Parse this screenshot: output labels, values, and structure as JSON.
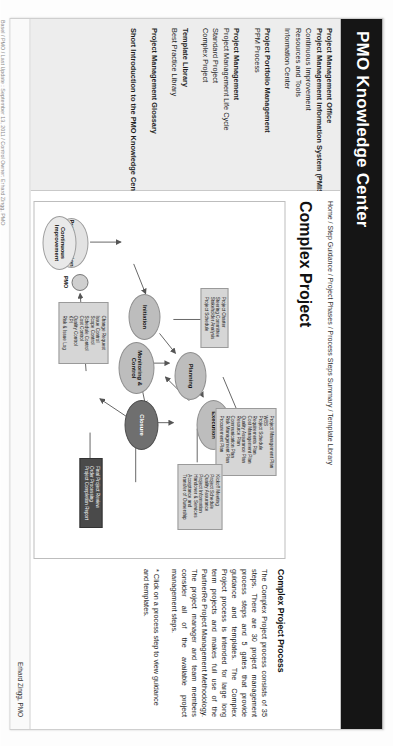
{
  "header": {
    "brand": "PMO Knowledge Center"
  },
  "sidebar": {
    "groups": [
      {
        "items": [
          {
            "label": "Project Management Office",
            "bold": true
          },
          {
            "label": "Project Management Information System (PMIS)",
            "bold": true
          },
          {
            "label": "Continuous Improvement",
            "bold": false
          },
          {
            "label": "Resources and Tools",
            "bold": false
          },
          {
            "label": "Information Center",
            "bold": false
          }
        ]
      },
      {
        "items": [
          {
            "label": "Project Portfolio Management",
            "bold": true
          },
          {
            "label": "PPM Process",
            "bold": false
          }
        ]
      },
      {
        "items": [
          {
            "label": "Project Management",
            "bold": true
          },
          {
            "label": "Project Management Life Cycle",
            "bold": false
          },
          {
            "label": "Standard Project",
            "bold": false
          },
          {
            "label": "Complex Project",
            "bold": false
          }
        ]
      },
      {
        "items": [
          {
            "label": "Template Library",
            "bold": true
          },
          {
            "label": "Best Practice Library",
            "bold": false
          }
        ]
      },
      {
        "items": [
          {
            "label": "Project Management Glossary",
            "bold": true
          }
        ]
      },
      {
        "items": [
          {
            "label": "Short Introduction to the PMO Knowledge Center",
            "bold": true
          }
        ]
      }
    ]
  },
  "content": {
    "breadcrumb": "Home / Step Guidance / Project Phases / Process Steps Summary / Template Library",
    "page_title": "Complex Project",
    "panel": {
      "heading": "Complex Project Process",
      "paragraph": "The Complex Project process consists of 35 steps. There are 30 project management process steps and 5 gates that provide guidance and templates. The Complex Project process is intended for large long term projects and makes full use of the PartnerRe Project Management Methodology. The project manager and team members consider all of the available project management steps.",
      "note": "* Click on a process step to view guidance and templates."
    }
  },
  "diagram": {
    "nodes": [
      {
        "id": "project-selection",
        "label": "Project Selection"
      },
      {
        "id": "initiation",
        "label": "Initiation"
      },
      {
        "id": "planning",
        "label": "Planning"
      },
      {
        "id": "execution",
        "label": "Execution"
      },
      {
        "id": "monitoring-control",
        "label": "Monitoring & Control"
      },
      {
        "id": "closure",
        "label": "Closure"
      },
      {
        "id": "continuous-improvement",
        "label": "Continuous Improvement"
      }
    ],
    "pmo_label": "PMO",
    "docs": {
      "initiation_docs": "Project Charter\nSteering Committee\nStakeholder Analysis\nProject Schedule",
      "monitoring_docs": "Change Request\nIssue Control\nScope Control\nSchedule Control\nCost Control\nQuality Control\nKPI\nRisk & Issue Log",
      "planning_docs": "Project Management Plan\nWBS\nProject Schedule\nRequirements Plan\nCost Management Plan\nQuality Assurance Plan\nResource Plan\nCommunication Plan\nRisk Management Plan\nProcurement Plan",
      "execution_docs": "Kickoff Meeting\nProject Schedule\nQuality Assurance\nProject Information\nHandover & Services\nAcceptance and\nTransfer of Ownership",
      "closure_docs": "Final Project Review\nOrder Processing\nProject Completion Report"
    }
  },
  "footer": {
    "credit": "Erhard Zingg, PMO"
  },
  "watermark": "Basel / PMO / Last Update : September 13, 2011 / Control Owner: Erhard Zingg, PMO"
}
